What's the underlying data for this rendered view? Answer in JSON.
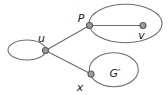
{
  "diagram": {
    "type": "graph-contraction-figure",
    "labels": {
      "u": "u",
      "P": "P",
      "v": "v",
      "x": "x",
      "g_prime": "G′"
    },
    "colors": {
      "background": "#ffffff",
      "stroke": "#6e6e6e",
      "node_fill": "#9c9c9c",
      "node_border": "#595959",
      "label": "#222222"
    }
  }
}
